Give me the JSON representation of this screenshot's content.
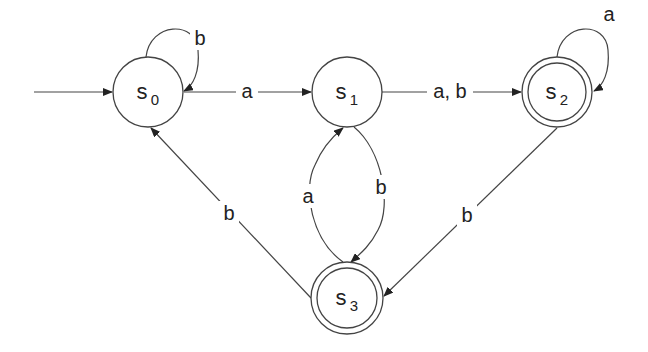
{
  "diagram": {
    "type": "finite-state-automaton",
    "colors": {
      "stroke": "#444444",
      "text": "#222222",
      "background": "#ffffff"
    },
    "start_state": "s0",
    "states": [
      {
        "id": "s0",
        "base": "s",
        "sub": "0",
        "accepting": false
      },
      {
        "id": "s1",
        "base": "s",
        "sub": "1",
        "accepting": false
      },
      {
        "id": "s2",
        "base": "s",
        "sub": "2",
        "accepting": true
      },
      {
        "id": "s3",
        "base": "s",
        "sub": "3",
        "accepting": true
      }
    ],
    "transitions": [
      {
        "from": "s0",
        "to": "s0",
        "label": "b"
      },
      {
        "from": "s0",
        "to": "s1",
        "label": "a"
      },
      {
        "from": "s1",
        "to": "s2",
        "label": "a, b"
      },
      {
        "from": "s2",
        "to": "s2",
        "label": "a"
      },
      {
        "from": "s1",
        "to": "s3",
        "label": "b"
      },
      {
        "from": "s3",
        "to": "s1",
        "label": "a"
      },
      {
        "from": "s2",
        "to": "s3",
        "label": "b"
      },
      {
        "from": "s3",
        "to": "s0",
        "label": "b"
      }
    ]
  }
}
